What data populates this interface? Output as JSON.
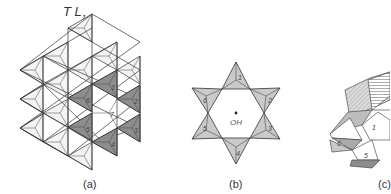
{
  "figure": {
    "panel_a": {
      "title_main": "T L",
      "title_sub": "1",
      "caption": "(a)",
      "numbers": [
        "1",
        "2",
        "3",
        "4",
        "5",
        "6",
        "7"
      ]
    },
    "panel_b": {
      "center_label": "OH",
      "caption": "(b)",
      "numbers": [
        "1",
        "2",
        "3",
        "4",
        "5",
        "6"
      ]
    },
    "panel_c": {
      "caption": "(c)",
      "numbers": [
        "1",
        "5",
        "6"
      ]
    },
    "colors": {
      "stroke": "#333333",
      "light_fill": "#e4e4e4",
      "dark_fill": "#8a8a8a",
      "medium_fill": "#bdbdbd"
    }
  }
}
